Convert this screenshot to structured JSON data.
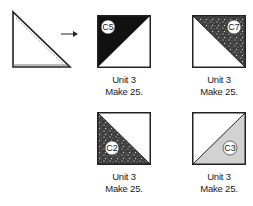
{
  "diagram": {
    "source_shape": {
      "description": "half-square triangle with dashed seam line"
    },
    "arrow": {
      "direction": "right"
    },
    "units": [
      {
        "fabric": "C5",
        "name": "Unit 3",
        "quantity": "Make 25.",
        "fill": "#111111",
        "pattern": "solid",
        "dark_half": "top-left"
      },
      {
        "fabric": "C7",
        "name": "Unit 3",
        "quantity": "Make 25.",
        "fill": "#3a3a3a",
        "pattern": "speckled",
        "dark_half": "top-right"
      },
      {
        "fabric": "C2",
        "name": "Unit 3",
        "quantity": "Make 25.",
        "fill": "#4a4a4a",
        "pattern": "speckled",
        "dark_half": "bottom-left"
      },
      {
        "fabric": "C3",
        "name": "Unit 3",
        "quantity": "Make 25.",
        "fill": "#d2d2d2",
        "pattern": "solid",
        "dark_half": "bottom-right"
      }
    ]
  }
}
